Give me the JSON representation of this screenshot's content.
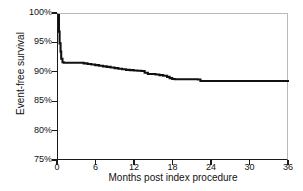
{
  "chart_data": {
    "type": "line",
    "title": "",
    "subtitle": "",
    "xlabel": "Months post index procedure",
    "ylabel": "Event-free survival",
    "xlim": [
      0,
      36
    ],
    "ylim": [
      75,
      100
    ],
    "xticks": [
      "0",
      "6",
      "12",
      "18",
      "24",
      "30",
      "36"
    ],
    "xtick_values": [
      0,
      6,
      12,
      18,
      24,
      30,
      36
    ],
    "yticks": [
      "75%",
      "80%",
      "85%",
      "90%",
      "95%",
      "100%"
    ],
    "ytick_values": [
      75,
      80,
      85,
      90,
      95,
      100
    ],
    "grid": false,
    "legend": null,
    "curve_style": "step",
    "line_color": "#111111",
    "frame_color": "#b9b9b9",
    "axis_color": "#1a1a1a",
    "series": [
      {
        "name": "Event-free survival",
        "x": [
          0,
          0.15,
          0.25,
          0.4,
          0.5,
          0.7,
          0.9,
          1.2,
          1.6,
          2.0,
          2.6,
          3.2,
          4.0,
          4.6,
          5.2,
          5.8,
          6.4,
          7.0,
          7.6,
          8.2,
          8.8,
          9.4,
          10.0,
          10.6,
          11.2,
          11.8,
          12.4,
          13.0,
          13.5,
          14.0,
          14.6,
          15.2,
          15.8,
          16.4,
          17.0,
          17.4,
          17.8,
          18.2,
          18.8,
          19.6,
          20.4,
          21.2,
          21.8,
          22.2,
          23.0,
          24.0,
          26.0,
          28.0,
          30.0,
          32.0,
          34.0,
          36.0
        ],
        "y": [
          100.0,
          97.0,
          95.0,
          93.6,
          92.4,
          91.8,
          91.7,
          91.7,
          91.7,
          91.7,
          91.7,
          91.7,
          91.6,
          91.5,
          91.4,
          91.3,
          91.2,
          91.1,
          91.0,
          90.9,
          90.8,
          90.7,
          90.6,
          90.5,
          90.45,
          90.4,
          90.35,
          90.3,
          90.0,
          89.8,
          89.8,
          89.7,
          89.6,
          89.5,
          89.3,
          89.1,
          88.95,
          88.9,
          88.9,
          88.9,
          88.9,
          88.9,
          88.85,
          88.6,
          88.6,
          88.6,
          88.6,
          88.6,
          88.6,
          88.6,
          88.6,
          88.6
        ]
      }
    ],
    "annotations": [],
    "notable_points": {
      "start_value": "100%",
      "initial_drop_to": "91.7%",
      "value_at_12_months": "90.4%",
      "value_at_18_months": "88.9%",
      "value_at_24_months": "88.6%",
      "final_value": "88.6%"
    }
  }
}
